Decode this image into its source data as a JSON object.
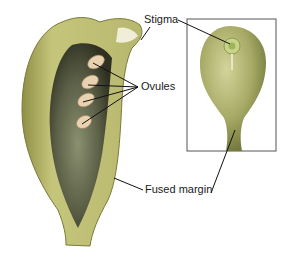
{
  "figure": {
    "labels": {
      "stigma": "Stigma",
      "ovules": "Ovules",
      "fused_margin": "Fused margin"
    }
  },
  "colors": {
    "outer_wall": "#b9b96a",
    "wall_light": "#cfd08a",
    "cavity_dark": "#4a4a35",
    "cavity_mid": "#7b8060",
    "ovule": "#e8d2b0",
    "inset_body": "#a9ad6a",
    "inset_border": "#555555",
    "leader_line": "#111111"
  }
}
